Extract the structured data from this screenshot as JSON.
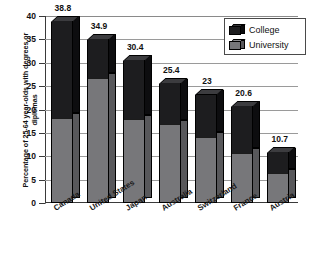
{
  "chart_data": {
    "type": "bar",
    "subtype": "stacked-3d-column",
    "title": "",
    "xlabel": "",
    "ylabel": "Percentage of 25-64 year-olds with degrees or diplomas",
    "ylim": [
      0,
      40
    ],
    "yticks": [
      0,
      5,
      10,
      15,
      20,
      25,
      30,
      35,
      40
    ],
    "ytick_labels": [
      "0",
      "5",
      "10",
      "15",
      "20",
      "25",
      "30",
      "35",
      "40"
    ],
    "grid": true,
    "legend_position": "top-right",
    "categories": [
      "Canada",
      "United States",
      "Japan",
      "Australia",
      "Switzerland",
      "France",
      "Austria"
    ],
    "series": [
      {
        "name": "University",
        "color": "#77777a",
        "values": [
          18.0,
          26.6,
          17.7,
          16.6,
          14,
          10.5,
          6.2
        ],
        "value_labels": [
          "18.0",
          "26.6",
          "17.7",
          "16.6",
          "14",
          "10.5",
          "6.2"
        ]
      },
      {
        "name": "College",
        "color": "#1d1d1f",
        "values": [
          20.8,
          8.3,
          12.7,
          8.8,
          9.0,
          10.1,
          4.5
        ],
        "value_labels": [
          "",
          "",
          "",
          "",
          "",
          "",
          ""
        ]
      }
    ],
    "totals": [
      38.8,
      34.9,
      30.4,
      25.4,
      23,
      20.6,
      10.7
    ],
    "total_labels": [
      "38.8",
      "34.9",
      "30.4",
      "25.4",
      "23",
      "20.6",
      "10.7"
    ]
  },
  "legend": {
    "items": [
      {
        "label": "College",
        "color": "#1d1d1f"
      },
      {
        "label": "University",
        "color": "#77777a"
      }
    ]
  },
  "axes": {
    "y_title": "Percentage of 25-64 year-olds with degrees or diplomas"
  }
}
